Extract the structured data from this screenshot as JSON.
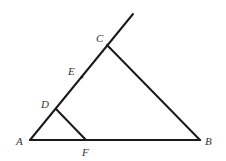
{
  "diagram": {
    "type": "geometry-triangle",
    "stroke_color": "#1a1a1a",
    "label_color": "#333333",
    "points": {
      "A": {
        "label": "A",
        "x": 30,
        "y": 140
      },
      "B": {
        "label": "B",
        "x": 200,
        "y": 140
      },
      "C": {
        "label": "C",
        "x": 107,
        "y": 45
      },
      "D": {
        "label": "D",
        "x": 56,
        "y": 109
      },
      "E": {
        "label": "E",
        "x": 82,
        "y": 77
      },
      "F": {
        "label": "F",
        "x": 86,
        "y": 140
      }
    },
    "segments": [
      {
        "from": "A",
        "to": "B"
      },
      {
        "from": "A",
        "to": "C",
        "extended": true
      },
      {
        "from": "C",
        "to": "B"
      },
      {
        "from": "D",
        "to": "F"
      }
    ],
    "labels": {
      "A": "A",
      "B": "B",
      "C": "C",
      "D": "D",
      "E": "E",
      "F": "F"
    }
  }
}
